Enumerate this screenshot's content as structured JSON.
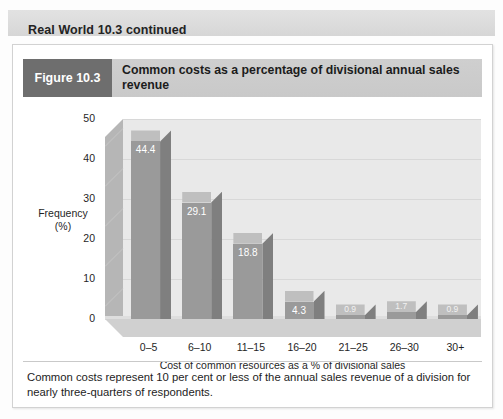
{
  "banner": {
    "title": "Real World 10.3 continued"
  },
  "figure": {
    "tag": "Figure 10.3",
    "title": "Common costs as a percentage of divisional annual sales revenue"
  },
  "caption": "Common costs represent 10 per cent or less of the annual sales revenue of a division for nearly three-quarters of respondents.",
  "colors": {
    "banner_bg": "#dcdcdc",
    "figure_tag_bg": "#6e6e6e",
    "figure_header_bg": "#cbcbcb",
    "bar_front": "#9a9a9a",
    "bar_side": "#7f7f7f",
    "bar_top": "#bfbfbf",
    "plot_bg": "#e9e9e9",
    "card_bg": "#ffffff"
  },
  "chart_data": {
    "type": "bar",
    "title": "Common costs as a percentage of divisional annual sales revenue",
    "xlabel": "Cost of common resources as a % of divisional sales",
    "ylabel": "Frequency (%)",
    "ylabel_line1": "Frequency",
    "ylabel_line2": "(%)",
    "categories": [
      "0–5",
      "6–10",
      "11–15",
      "16–20",
      "21–25",
      "26–30",
      "30+"
    ],
    "values": [
      44.4,
      29.1,
      18.8,
      4.3,
      0.9,
      1.7,
      0.9
    ],
    "value_labels": [
      "44.4",
      "29.1",
      "18.8",
      "4.3",
      "0.9",
      "1.7",
      "0.9"
    ],
    "ylim": [
      0,
      50
    ],
    "yticks": [
      0,
      10,
      20,
      30,
      40,
      50
    ],
    "ytick_labels": [
      "0",
      "10",
      "20",
      "30",
      "40",
      "50"
    ],
    "grid": true,
    "legend": false,
    "style": "3d-column"
  }
}
